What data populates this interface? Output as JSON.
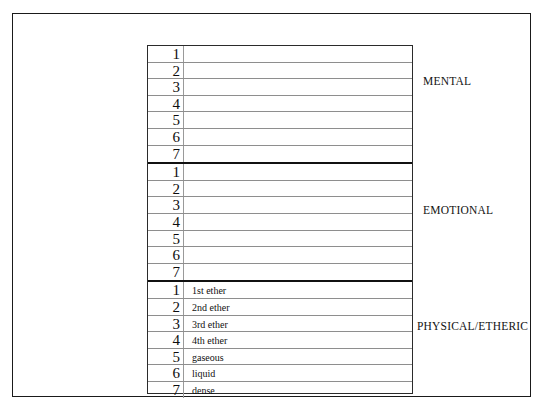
{
  "diagram": {
    "background_color": "#ffffff",
    "line_color": "#8e8e8e",
    "divider_color": "#111111",
    "frame_color": "#1a1a1a",
    "sections": [
      {
        "id": "mental",
        "caption": "MENTAL",
        "rows": [
          {
            "number": "1",
            "label": ""
          },
          {
            "number": "2",
            "label": ""
          },
          {
            "number": "3",
            "label": ""
          },
          {
            "number": "4",
            "label": ""
          },
          {
            "number": "5",
            "label": ""
          },
          {
            "number": "6",
            "label": ""
          },
          {
            "number": "7",
            "label": ""
          }
        ]
      },
      {
        "id": "emotional",
        "caption": "EMOTIONAL",
        "rows": [
          {
            "number": "1",
            "label": ""
          },
          {
            "number": "2",
            "label": ""
          },
          {
            "number": "3",
            "label": ""
          },
          {
            "number": "4",
            "label": ""
          },
          {
            "number": "5",
            "label": ""
          },
          {
            "number": "6",
            "label": ""
          },
          {
            "number": "7",
            "label": ""
          }
        ]
      },
      {
        "id": "physical-etheric",
        "caption": "PHYSICAL/ETHERIC",
        "rows": [
          {
            "number": "1",
            "label": "1st ether"
          },
          {
            "number": "2",
            "label": "2nd ether"
          },
          {
            "number": "3",
            "label": "3rd ether"
          },
          {
            "number": "4",
            "label": "4th ether"
          },
          {
            "number": "5",
            "label": "gaseous"
          },
          {
            "number": "6",
            "label": "liquid"
          },
          {
            "number": "7",
            "label": "dense"
          }
        ]
      }
    ]
  }
}
